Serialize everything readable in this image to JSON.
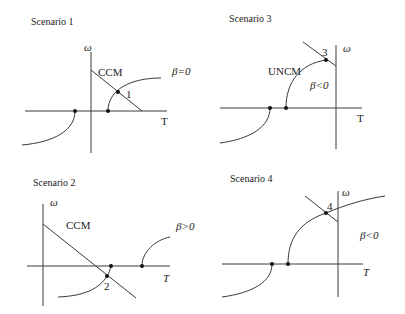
{
  "panels": [
    {
      "title": "Scenario 1",
      "y_axis_label": "ω",
      "x_axis_label": "T",
      "line_label": "CCM",
      "point_label": "1",
      "beta_label": "β=0"
    },
    {
      "title": "Scenario 2",
      "y_axis_label": "ω",
      "x_axis_label": "T",
      "line_label": "CCM",
      "point_label": "2",
      "beta_label": "β>0"
    },
    {
      "title": "Scenario 3",
      "y_axis_label": "ω",
      "x_axis_label": "T",
      "line_label": "UNCM",
      "point_label": "3",
      "beta_label": "β<0"
    },
    {
      "title": "Scenario 4",
      "y_axis_label": "ω",
      "x_axis_label": "T",
      "point_label": "4",
      "beta_label": "β<0"
    }
  ],
  "colors": {
    "line": "#3a3a3a",
    "dot": "#111111",
    "background": "#ffffff"
  }
}
